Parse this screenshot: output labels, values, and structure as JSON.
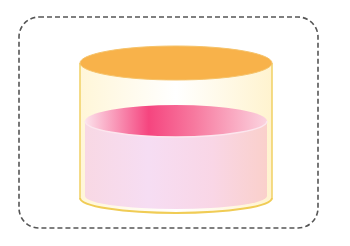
{
  "figure": {
    "frame": {
      "style": "dashed rounded rectangle",
      "color": "#555555"
    },
    "cylinder": {
      "lid_color": "#F8B24A",
      "outline_color": "#F2D36B",
      "glass_color": "#FFFBEA"
    },
    "liquid": {
      "surface_color_strong": "#F5457F",
      "surface_color_light": "#FBC6D6",
      "body_color_left": "#F6D6EE",
      "body_color_right": "#FAD0CC"
    }
  }
}
